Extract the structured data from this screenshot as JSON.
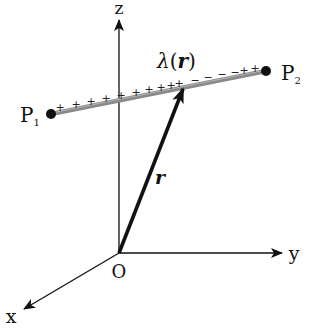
{
  "diagram": {
    "colors": {
      "axis": "#111111",
      "vector": "#111111",
      "charge_line": "#8a8a8a",
      "point": "#111111",
      "background": "#ffffff"
    },
    "axes": {
      "z_label": "z",
      "y_label": "y",
      "x_label": "x",
      "origin_label": "O"
    },
    "points": {
      "p1": {
        "label": "P",
        "subscript": "1"
      },
      "p2": {
        "label": "P",
        "subscript": "2"
      }
    },
    "charge_line": {
      "density_label": "λ(r)",
      "density_symbol": "λ",
      "density_argument": "r",
      "left_signs": [
        "+",
        "+",
        "+",
        "+",
        "+",
        "+",
        "+",
        "+",
        "+",
        "+"
      ],
      "middle_signs": [
        "−",
        "−",
        "−",
        "−"
      ],
      "right_signs": [
        "+",
        "+"
      ]
    },
    "vector": {
      "label": "r"
    }
  }
}
